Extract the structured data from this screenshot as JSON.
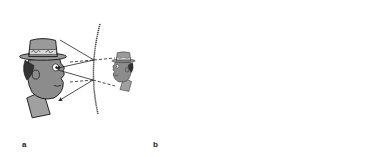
{
  "diagram": {
    "panels": [
      {
        "label": "a",
        "mirror": "convex",
        "image": "smaller virtual image behind mirror"
      },
      {
        "label": "b",
        "mirror": "concave",
        "image": "larger virtual image behind mirror"
      }
    ],
    "colors": {
      "skin": "#8c8c8c",
      "hat": "#9a9a9a",
      "band": "#d8d8d8",
      "line": "#1a1a1a",
      "background": "#ffffff"
    }
  }
}
